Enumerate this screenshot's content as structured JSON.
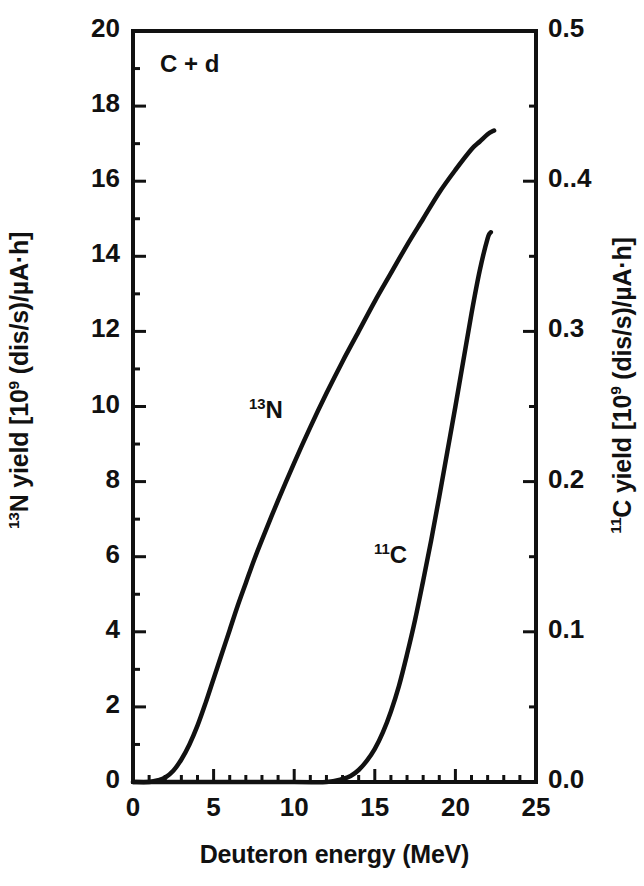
{
  "figure": {
    "background_color": "#ffffff",
    "line_color": "#111111",
    "frame_color": "#111111"
  },
  "annotations": {
    "system_label": "C + d",
    "curve_label_n13_pre": "13",
    "curve_label_n13_main": "N",
    "curve_label_c11_pre": "11",
    "curve_label_c11_main": "C"
  },
  "axes": {
    "x_title": "Deuteron energy (MeV)",
    "y_left_title_pre": "13",
    "y_left_title_main": "N yield [10",
    "y_left_title_sup": "9",
    "y_left_title_tail": " (dis/s)/µA·h]",
    "y_right_title_pre": "11",
    "y_right_title_main": "C yield [10",
    "y_right_title_sup": "9",
    "y_right_title_tail": " (dis/s)/µA·h]",
    "x_ticks": [
      "0",
      "5",
      "10",
      "15",
      "20",
      "25"
    ],
    "y_left_ticks": [
      "0",
      "2",
      "4",
      "6",
      "8",
      "10",
      "12",
      "14",
      "16",
      "18",
      "20"
    ],
    "y_right_ticks": [
      "0.0",
      "0.1",
      "0.2",
      "0.3",
      "0..4",
      "0.5"
    ]
  },
  "chart_data": {
    "type": "line",
    "title": "",
    "subtitle": "",
    "xlabel": "Deuteron energy (MeV)",
    "ylabel": "13N yield [10^9 (dis/s)/µA·h]",
    "ylabel_right": "11C yield [10^9 (dis/s)/µA·h]",
    "xlim": [
      0,
      25
    ],
    "ylim": [
      0,
      20
    ],
    "ylim_right": [
      0.0,
      0.5
    ],
    "grid": false,
    "legend": "inline-curve-labels",
    "annotation": "C + d",
    "series": [
      {
        "name": "13N",
        "axis": "left",
        "label": "13N",
        "units": "10^9 (dis/s)/µA·h",
        "x": [
          0.0,
          1.0,
          1.6,
          2.0,
          2.5,
          3.0,
          3.5,
          4.0,
          4.5,
          5.0,
          5.5,
          6.0,
          6.5,
          7.0,
          7.5,
          8.0,
          9.0,
          10.0,
          11.0,
          12.0,
          13.0,
          14.0,
          15.0,
          16.0,
          17.0,
          18.0,
          19.0,
          20.0,
          21.0,
          21.5,
          22.0,
          22.4
        ],
        "y": [
          0.0,
          0.0,
          0.05,
          0.12,
          0.3,
          0.6,
          1.0,
          1.5,
          2.1,
          2.75,
          3.4,
          4.05,
          4.7,
          5.3,
          5.9,
          6.45,
          7.5,
          8.5,
          9.45,
          10.35,
          11.2,
          12.0,
          12.8,
          13.55,
          14.3,
          15.0,
          15.7,
          16.3,
          16.85,
          17.05,
          17.25,
          17.35
        ]
      },
      {
        "name": "11C",
        "axis": "right",
        "label": "11C",
        "units": "10^9 (dis/s)/µA·h",
        "x": [
          0.0,
          5.0,
          10.0,
          12.0,
          13.0,
          13.5,
          14.0,
          14.5,
          15.0,
          15.5,
          16.0,
          16.5,
          17.0,
          17.5,
          18.0,
          18.5,
          19.0,
          19.5,
          20.0,
          20.5,
          21.0,
          21.5,
          22.0,
          22.2
        ],
        "y": [
          0.0,
          0.0,
          0.0,
          0.0,
          0.002,
          0.004,
          0.008,
          0.014,
          0.022,
          0.033,
          0.047,
          0.064,
          0.085,
          0.108,
          0.134,
          0.161,
          0.19,
          0.22,
          0.25,
          0.281,
          0.312,
          0.34,
          0.362,
          0.366
        ]
      }
    ]
  },
  "plot_geometry": {
    "left": 133,
    "right": 536,
    "top": 31,
    "bottom": 782
  }
}
